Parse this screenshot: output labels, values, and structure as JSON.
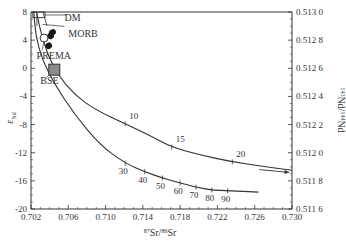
{
  "chart_data": {
    "type": "line",
    "title": "",
    "xlabel": "87Sr/86Sr",
    "xlabel_parts": {
      "sup1": "87",
      "base1": "Sr/",
      "sup2": "86",
      "base2": "Sr"
    },
    "ylabel": "εNd",
    "ylabel_parts": {
      "base": "ε",
      "sub": "Nd"
    },
    "y2label": "143Nd/144Nd",
    "y2label_parts": {
      "sup1": "143",
      "base1": "Nd/",
      "sup2": "144",
      "base2": "Nd"
    },
    "xlim": [
      0.702,
      0.73
    ],
    "ylim": [
      -20,
      8
    ],
    "y2lim": [
      0.5116,
      0.513
    ],
    "xticks": [
      "0.702",
      "0.706",
      "0.710",
      "0.714",
      "0.718",
      "0.722",
      "0.726",
      "0.730"
    ],
    "yticks": [
      "8",
      "4",
      "0",
      "-4",
      "-8",
      "-12",
      "-16",
      "-20"
    ],
    "y2ticks": [
      "0.513 0",
      "0.512 8",
      "0.512 6",
      "0.512 4",
      "0.512 2",
      "0.512 0",
      "0.511 8",
      "0.511 6"
    ],
    "grid": false,
    "series": [
      {
        "name": "upper mixing curve",
        "x": [
          0.7026,
          0.703,
          0.7038,
          0.7049,
          0.7067,
          0.7089,
          0.7121,
          0.7148,
          0.7171,
          0.7201,
          0.7236,
          0.7271,
          0.73
        ],
        "y": [
          8.0,
          5.4,
          1.9,
          -1.0,
          -3.8,
          -5.9,
          -7.9,
          -9.6,
          -11.2,
          -12.3,
          -13.3,
          -14.0,
          -14.5
        ],
        "marks": [
          {
            "label": "10",
            "x": 0.7121,
            "y": -7.9
          },
          {
            "label": "15",
            "x": 0.7171,
            "y": -11.2
          },
          {
            "label": "20",
            "x": 0.7236,
            "y": -13.3
          }
        ]
      },
      {
        "name": "lower mixing curve",
        "x": [
          0.7023,
          0.7025,
          0.7032,
          0.7046,
          0.7067,
          0.7094,
          0.7121,
          0.7142,
          0.7161,
          0.718,
          0.7197,
          0.7214,
          0.7231,
          0.7264
        ],
        "y": [
          8.0,
          4.7,
          1.2,
          -2.4,
          -6.6,
          -10.9,
          -13.5,
          -14.7,
          -15.6,
          -16.3,
          -16.9,
          -17.3,
          -17.4,
          -17.6
        ],
        "marks": [
          {
            "label": "30",
            "x": 0.7121,
            "y": -13.5
          },
          {
            "label": "40",
            "x": 0.7142,
            "y": -14.7
          },
          {
            "label": "50",
            "x": 0.7161,
            "y": -15.6
          },
          {
            "label": "60",
            "x": 0.718,
            "y": -16.3
          },
          {
            "label": "70",
            "x": 0.7197,
            "y": -16.9
          },
          {
            "label": "80",
            "x": 0.7214,
            "y": -17.3
          },
          {
            "label": "90",
            "x": 0.7231,
            "y": -17.4
          }
        ]
      }
    ],
    "arrow": {
      "from": [
        0.7265,
        -14.4
      ],
      "to": [
        0.7297,
        -14.8
      ]
    },
    "reservoirs": [
      {
        "name": "DM",
        "shape": "box-outline",
        "x": [
          0.7022,
          0.7035
        ],
        "y": [
          7.2,
          8.0
        ]
      },
      {
        "name": "MORB",
        "shape": "filled-dots",
        "points": [
          [
            0.7043,
            5.1
          ],
          [
            0.7041,
            4.6
          ],
          [
            0.7039,
            3.2
          ]
        ]
      },
      {
        "name": "PREMA",
        "shape": "open-circle",
        "x": 0.7034,
        "y": 4.3
      },
      {
        "name": "BSE",
        "shape": "gray-square",
        "x": 0.7045,
        "y": -0.2
      }
    ],
    "annotations": [
      {
        "text": "DM",
        "x": 0.7056,
        "y": 6.7
      },
      {
        "text": "MORB",
        "x": 0.706,
        "y": 4.4
      },
      {
        "text": "PREMA",
        "x": 0.7026,
        "y": 1.3
      },
      {
        "text": "BSE",
        "x": 0.703,
        "y": -2.2
      }
    ],
    "colors": {
      "line": "#333333",
      "bse_fill": "#8a8a8a",
      "dot_fill": "#1a1a1a"
    }
  }
}
